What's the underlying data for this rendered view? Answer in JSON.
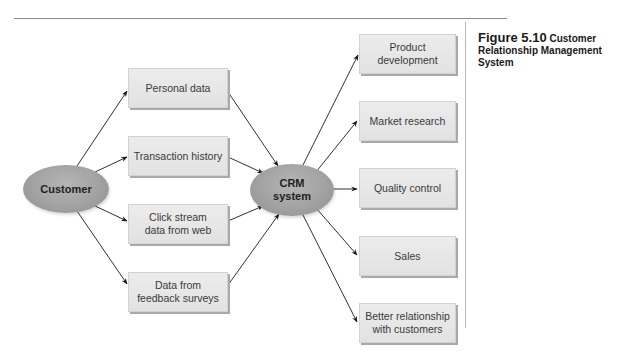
{
  "figure": {
    "number_label": "Figure 5.10",
    "title_line1": "Customer",
    "title_line2": "Relationship Management",
    "title_line3": "System"
  },
  "diagram": {
    "source_node": {
      "label": "Customer"
    },
    "hub_node": {
      "label": "CRM\nsystem"
    },
    "inputs": [
      {
        "label": "Personal data"
      },
      {
        "label": "Transaction history"
      },
      {
        "label": "Click stream\ndata from web"
      },
      {
        "label": "Data from\nfeedback surveys"
      }
    ],
    "outputs": [
      {
        "label": "Product\ndevelopment"
      },
      {
        "label": "Market research"
      },
      {
        "label": "Quality control"
      },
      {
        "label": "Sales"
      },
      {
        "label": "Better relationship\nwith customers"
      }
    ],
    "edges": [
      {
        "from": "Customer",
        "to": "Personal data"
      },
      {
        "from": "Customer",
        "to": "Transaction history"
      },
      {
        "from": "Customer",
        "to": "Click stream data from web"
      },
      {
        "from": "Customer",
        "to": "Data from feedback surveys"
      },
      {
        "from": "Personal data",
        "to": "CRM system"
      },
      {
        "from": "Transaction history",
        "to": "CRM system"
      },
      {
        "from": "Click stream data from web",
        "to": "CRM system"
      },
      {
        "from": "Data from feedback surveys",
        "to": "CRM system"
      },
      {
        "from": "CRM system",
        "to": "Product development"
      },
      {
        "from": "CRM system",
        "to": "Market research"
      },
      {
        "from": "CRM system",
        "to": "Quality control"
      },
      {
        "from": "CRM system",
        "to": "Sales"
      },
      {
        "from": "CRM system",
        "to": "Better relationship with customers"
      }
    ]
  },
  "colors": {
    "box_fill": "#e6e6e6",
    "box_shadow": "#a9a9a9",
    "ellipse_fill": "#a2a2a2",
    "arrow": "#1a1a1a",
    "rule": "#8a8a8a"
  }
}
